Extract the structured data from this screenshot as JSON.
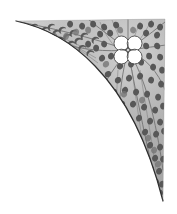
{
  "artwork": {
    "title": "Corner Spandrel Ornament",
    "subject": "decorative foliate corner bracket with four-petal rosette",
    "style": "engraving / halftone shading",
    "orientation": "top-right corner",
    "canvas": {
      "width": 177,
      "height": 214
    },
    "background_color": "#ffffff"
  },
  "palette": {
    "paper": "#ffffff",
    "band_fill_light": "#c9c9c9",
    "band_fill_mid": "#b4b4b4",
    "band_fill_dark": "#9d9d9d",
    "outline": "#2f2f2f",
    "vein_line": "#6f6f6f",
    "spot_dark": "#585858",
    "spot_mid": "#6e6e6e",
    "petal_fill": "#ffffff",
    "petal_outline": "#4a4a4a"
  },
  "geometry": {
    "corner_apex": {
      "x": 165,
      "y": 19
    },
    "upper_tip": {
      "x": 16,
      "y": 21
    },
    "lower_tip": {
      "x": 163,
      "y": 201
    },
    "inner_curve_control": {
      "x": 62,
      "y": 62
    },
    "top_edge_y": 19,
    "right_edge_x": 165
  },
  "rosette": {
    "label": "four-petal flower",
    "center": {
      "x": 128,
      "y": 50
    },
    "petal_count": 4,
    "petal_radius": 7.4,
    "petal_offset": 6.6,
    "fill": "#ffffff",
    "outline": "#4a4a4a"
  },
  "veins": {
    "label": "radiating vein lines",
    "origin": {
      "x": 128,
      "y": 50
    },
    "count": 11,
    "color": "#6f6f6f"
  },
  "spots": {
    "label": "teardrop foliage spots",
    "shape": "comma / teardrop",
    "approximate_count": 120,
    "color_dark": "#585858",
    "color_mid": "#6e6e6e"
  }
}
